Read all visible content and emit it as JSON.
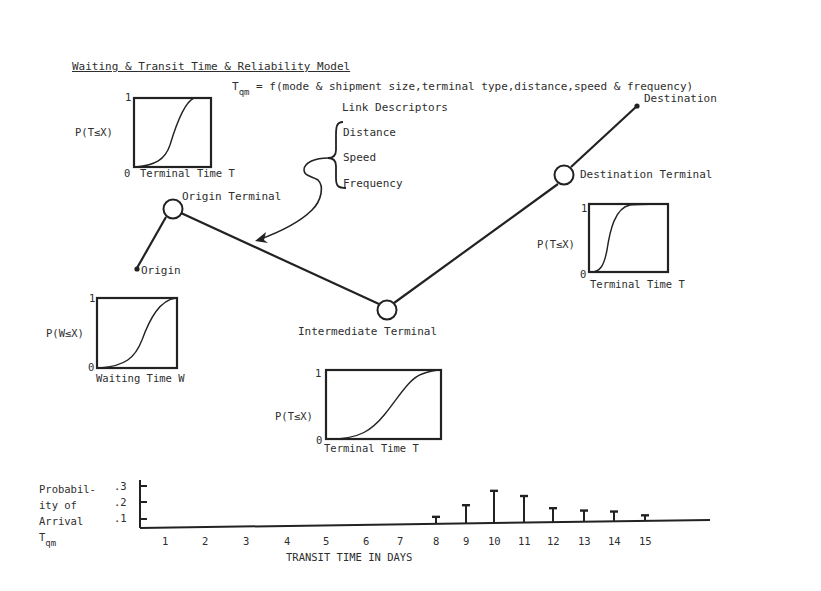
{
  "title": "Waiting & Transit Time & Reliability Model",
  "equation": {
    "lhs": "T",
    "lhs_sub": "qm",
    "rhs": "= f(mode & shipment size,terminal type,distance,speed & frequency)"
  },
  "link_descriptors": {
    "heading": "Link Descriptors",
    "items": [
      "Distance",
      "Speed",
      "Frequency"
    ]
  },
  "nodes": {
    "origin": "Origin",
    "origin_terminal": "Origin Terminal",
    "intermediate_terminal": "Intermediate Terminal",
    "destination_terminal": "Destination Terminal",
    "destination": "Destination"
  },
  "cdf_panels": {
    "origin_terminal": {
      "ylabel": "P(T≤X)",
      "y_top": "1",
      "y_bottom": "0",
      "xlabel": "Terminal Time T"
    },
    "waiting": {
      "ylabel": "P(W≤X)",
      "y_top": "1",
      "y_bottom": "0",
      "xlabel": "Waiting Time W"
    },
    "intermediate_terminal": {
      "ylabel": "P(T≤X)",
      "y_top": "1",
      "y_bottom": "0",
      "xlabel": "Terminal Time T"
    },
    "destination_terminal": {
      "ylabel": "P(T≤X)",
      "y_top": "1",
      "y_bottom": "0",
      "xlabel": "Terminal Time T"
    }
  },
  "chart_data": {
    "type": "bar",
    "title": "",
    "xlabel": "TRANSIT TIME IN DAYS",
    "ylabel_lines": [
      "Probabil-",
      "ity of",
      "Arrival",
      "T"
    ],
    "ylabel_sub": "qm",
    "y_ticks": [
      ".1",
      ".2",
      ".3"
    ],
    "ylim": [
      0,
      0.3
    ],
    "categories": [
      "1",
      "2",
      "3",
      "4",
      "5",
      "6",
      "7",
      "8",
      "9",
      "10",
      "11",
      "12",
      "13",
      "14",
      "15"
    ],
    "values": [
      0,
      0,
      0,
      0,
      0,
      0,
      0,
      0.05,
      0.13,
      0.23,
      0.19,
      0.1,
      0.08,
      0.07,
      0.04
    ],
    "grid": false,
    "legend": null
  }
}
